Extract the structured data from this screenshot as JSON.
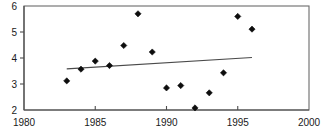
{
  "chart_data": {
    "type": "scatter",
    "title": "",
    "xlabel": "",
    "ylabel": "",
    "xlim": [
      1980,
      2000
    ],
    "ylim": [
      2,
      6
    ],
    "grid": false,
    "legend": null,
    "x_ticks": [
      1980,
      1985,
      1990,
      1995,
      2000
    ],
    "x_tick_labels": [
      "1980",
      "1985",
      "1990",
      "1995",
      "2000"
    ],
    "y_ticks": [
      2,
      3,
      4,
      5,
      6
    ],
    "y_tick_labels": [
      "2",
      "3",
      "4",
      "5",
      "6"
    ],
    "marker_style": "diamond",
    "marker_color": "#0d0d0d",
    "points": [
      {
        "x": 1983,
        "y": 3.12
      },
      {
        "x": 1984,
        "y": 3.57
      },
      {
        "x": 1985,
        "y": 3.88
      },
      {
        "x": 1986,
        "y": 3.71
      },
      {
        "x": 1987,
        "y": 4.48
      },
      {
        "x": 1988,
        "y": 5.7
      },
      {
        "x": 1989,
        "y": 4.23
      },
      {
        "x": 1990,
        "y": 2.85
      },
      {
        "x": 1991,
        "y": 2.94
      },
      {
        "x": 1992,
        "y": 2.08
      },
      {
        "x": 1993,
        "y": 2.66
      },
      {
        "x": 1994,
        "y": 3.43
      },
      {
        "x": 1995,
        "y": 5.6
      },
      {
        "x": 1996,
        "y": 5.11
      }
    ],
    "series": [
      {
        "name": "trend-line",
        "type": "line",
        "color": "#4a4a4a",
        "x": [
          1983,
          1996
        ],
        "values": [
          3.58,
          4.02
        ]
      }
    ]
  }
}
